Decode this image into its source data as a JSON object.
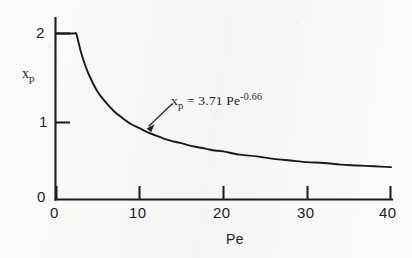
{
  "chart_data": {
    "type": "line",
    "title": "",
    "xlabel": "Pe",
    "ylabel": "xp",
    "ylabel_base": "x",
    "ylabel_sub": "p",
    "xlim": [
      0,
      40
    ],
    "ylim": [
      0,
      2.15
    ],
    "grid": false,
    "legend": null,
    "x_ticks": [
      "0",
      "10",
      "20",
      "30",
      "40"
    ],
    "x_tick_values": [
      0,
      10,
      20,
      30,
      40
    ],
    "y_ticks": [
      "0",
      "1",
      "2"
    ],
    "y_tick_values": [
      0,
      1,
      2
    ],
    "annotation": {
      "text": "xp = 3.71 Pe-0.66",
      "var_base": "x",
      "var_sub": "p",
      "equals": " = 3.71  Pe",
      "exponent": "-0.66",
      "points_to_x": 12.2,
      "points_to_y": 0.72
    },
    "equation": {
      "coefficient": 3.71,
      "exponent": -0.66,
      "plateau_value": 2,
      "plateau_until_x": 2.24
    },
    "series": [
      {
        "name": "xp = 3.71 Pe^-0.66",
        "x": [
          0,
          1,
          2,
          2.24,
          2.5,
          3,
          3.5,
          4,
          5,
          6,
          7,
          8,
          9,
          10,
          11,
          12,
          13,
          14,
          15,
          16,
          17,
          18,
          19,
          20,
          22,
          24,
          26,
          28,
          30,
          32,
          34,
          36,
          38,
          40
        ],
        "y": [
          2.0,
          2.0,
          2.0,
          2.0,
          1.99,
          1.79,
          1.63,
          1.5,
          1.3,
          1.17,
          1.06,
          0.98,
          0.91,
          0.86,
          0.81,
          0.77,
          0.73,
          0.7,
          0.68,
          0.65,
          0.63,
          0.61,
          0.59,
          0.58,
          0.54,
          0.52,
          0.49,
          0.47,
          0.45,
          0.44,
          0.42,
          0.41,
          0.4,
          0.39
        ]
      }
    ]
  },
  "colors": {
    "ink": "#1b1b1b",
    "paper": "#f8f7f3"
  }
}
